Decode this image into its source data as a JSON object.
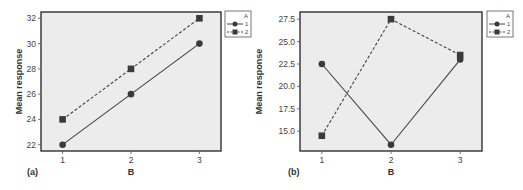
{
  "chart_data": [
    {
      "type": "line",
      "panel_label": "(a)",
      "title": "",
      "xlabel": "B",
      "ylabel": "Mean response",
      "categories": [
        "1",
        "2",
        "3"
      ],
      "yticks": [
        "22",
        "24",
        "26",
        "28",
        "30",
        "32"
      ],
      "ylim": [
        21.5,
        32.5
      ],
      "grid": false,
      "legend": {
        "title": "A",
        "position": "right-top",
        "entries": [
          "1",
          "2"
        ]
      },
      "series": [
        {
          "name": "1",
          "marker": "circle",
          "line": "solid",
          "values": [
            22,
            26,
            30
          ]
        },
        {
          "name": "2",
          "marker": "square",
          "line": "dashed",
          "values": [
            24,
            28,
            32
          ]
        }
      ]
    },
    {
      "type": "line",
      "panel_label": "(b)",
      "title": "",
      "xlabel": "B",
      "ylabel": "Mean response",
      "categories": [
        "1",
        "2",
        "3"
      ],
      "yticks": [
        "15.0",
        "17.5",
        "20.0",
        "22.5",
        "25.0",
        "27.5"
      ],
      "ylim": [
        12.8,
        28.3
      ],
      "grid": false,
      "legend": {
        "title": "A",
        "position": "right-top",
        "entries": [
          "1",
          "2"
        ]
      },
      "series": [
        {
          "name": "1",
          "marker": "circle",
          "line": "solid",
          "values": [
            22.5,
            13.5,
            23.0
          ]
        },
        {
          "name": "2",
          "marker": "square",
          "line": "dashed",
          "values": [
            14.5,
            27.5,
            23.5
          ]
        }
      ]
    }
  ],
  "colors": {
    "plot_background": "#ececec",
    "frame": "#222222",
    "series": "#444444",
    "marker": "#3a3a3a"
  }
}
